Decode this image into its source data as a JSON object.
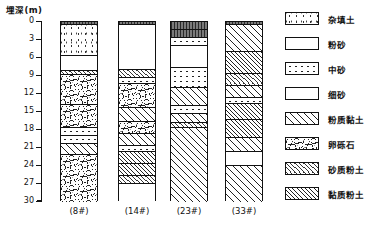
{
  "figure": {
    "axis_title": "埋深(m)",
    "axis": {
      "min": 0,
      "max": 30,
      "step": 3,
      "ticks": [
        "0",
        "3",
        "6",
        "9",
        "12",
        "15",
        "18",
        "21",
        "24",
        "27",
        "30"
      ]
    }
  },
  "legend": {
    "items": [
      {
        "label": "杂填土",
        "pattern": "p-fill"
      },
      {
        "label": "粉砂",
        "pattern": "p-siltsand"
      },
      {
        "label": "中砂",
        "pattern": "p-medsand"
      },
      {
        "label": "细砂",
        "pattern": "p-finesand"
      },
      {
        "label": "粉质黏土",
        "pattern": "p-siltclay"
      },
      {
        "label": "卵砾石",
        "pattern": "p-gravel"
      },
      {
        "label": "砂质粉土",
        "pattern": "p-sandysilt"
      },
      {
        "label": "黏质粉土",
        "pattern": "p-claysilt"
      }
    ]
  },
  "chart_data": {
    "type": "table",
    "ylabel": "埋深(m)",
    "ylim": [
      0,
      30
    ],
    "yticks": [
      0,
      3,
      6,
      9,
      12,
      15,
      18,
      21,
      24,
      27,
      30
    ],
    "boreholes": [
      {
        "name": "(8#)",
        "x": 60,
        "layers": [
          {
            "top": 0.0,
            "bottom": 0.5,
            "soil": "杂填土",
            "pattern": "p-crust"
          },
          {
            "top": 0.5,
            "bottom": 5.6,
            "soil": "杂填土",
            "pattern": "p-fill"
          },
          {
            "top": 5.6,
            "bottom": 8.2,
            "soil": "粉砂",
            "pattern": "p-siltsand"
          },
          {
            "top": 8.2,
            "bottom": 8.8,
            "soil": "砂质粉土",
            "pattern": "p-sandysilt"
          },
          {
            "top": 8.8,
            "bottom": 13.8,
            "soil": "卵砾石",
            "pattern": "p-gravel"
          },
          {
            "top": 13.8,
            "bottom": 17.6,
            "soil": "卵砾石",
            "pattern": "p-gravel"
          },
          {
            "top": 17.6,
            "bottom": 19.0,
            "soil": "中砂",
            "pattern": "p-medsand"
          },
          {
            "top": 19.0,
            "bottom": 20.4,
            "soil": "中砂",
            "pattern": "p-medsand"
          },
          {
            "top": 20.4,
            "bottom": 22.2,
            "soil": "粉质黏土",
            "pattern": "p-siltclay"
          },
          {
            "top": 22.2,
            "bottom": 30.0,
            "soil": "卵砾石",
            "pattern": "p-gravel"
          }
        ]
      },
      {
        "name": "(14#)",
        "x": 118,
        "layers": [
          {
            "top": 0.0,
            "bottom": 0.5,
            "soil": "杂填土",
            "pattern": "p-crust"
          },
          {
            "top": 0.5,
            "bottom": 8.0,
            "soil": "粉砂",
            "pattern": "p-siltsand"
          },
          {
            "top": 8.0,
            "bottom": 9.4,
            "soil": "砂质粉土",
            "pattern": "p-sandysilt"
          },
          {
            "top": 9.4,
            "bottom": 10.4,
            "soil": "中砂",
            "pattern": "p-medsand"
          },
          {
            "top": 10.4,
            "bottom": 14.4,
            "soil": "卵砾石",
            "pattern": "p-gravel"
          },
          {
            "top": 14.4,
            "bottom": 16.6,
            "soil": "粉质黏土",
            "pattern": "p-siltclay"
          },
          {
            "top": 16.6,
            "bottom": 18.6,
            "soil": "卵砾石",
            "pattern": "p-gravel"
          },
          {
            "top": 18.6,
            "bottom": 20.6,
            "soil": "粉质黏土",
            "pattern": "p-siltclay"
          },
          {
            "top": 20.6,
            "bottom": 21.6,
            "soil": "中砂",
            "pattern": "p-medsand"
          },
          {
            "top": 21.6,
            "bottom": 23.6,
            "soil": "黏质粉土",
            "pattern": "p-claysilt"
          },
          {
            "top": 23.6,
            "bottom": 25.6,
            "soil": "黏质粉土",
            "pattern": "p-claysilt"
          },
          {
            "top": 25.6,
            "bottom": 27.0,
            "soil": "砂质粉土",
            "pattern": "p-sandysilt"
          },
          {
            "top": 27.0,
            "bottom": 30.0,
            "soil": "细砂",
            "pattern": "p-finesand"
          }
        ]
      },
      {
        "name": "(23#)",
        "x": 170,
        "layers": [
          {
            "top": 0.0,
            "bottom": 1.4,
            "soil": "杂填土",
            "pattern": "p-crust"
          },
          {
            "top": 1.4,
            "bottom": 2.6,
            "soil": "杂填土",
            "pattern": "p-crust"
          },
          {
            "top": 2.6,
            "bottom": 4.0,
            "soil": "中砂",
            "pattern": "p-medsand"
          },
          {
            "top": 4.0,
            "bottom": 7.6,
            "soil": "粉砂",
            "pattern": "p-siltsand"
          },
          {
            "top": 7.6,
            "bottom": 11.0,
            "soil": "中砂",
            "pattern": "p-medsand"
          },
          {
            "top": 11.0,
            "bottom": 14.0,
            "soil": "粉质黏土",
            "pattern": "p-siltclay"
          },
          {
            "top": 14.0,
            "bottom": 15.4,
            "soil": "中砂",
            "pattern": "p-medsand"
          },
          {
            "top": 15.4,
            "bottom": 16.8,
            "soil": "粉质黏土",
            "pattern": "p-siltclay"
          },
          {
            "top": 16.8,
            "bottom": 17.6,
            "soil": "砂质粉土",
            "pattern": "p-sandysilt"
          },
          {
            "top": 17.6,
            "bottom": 30.0,
            "soil": "粉质黏土",
            "pattern": "p-siltclay"
          }
        ]
      },
      {
        "name": "(33#)",
        "x": 225,
        "layers": [
          {
            "top": 0.0,
            "bottom": 0.5,
            "soil": "杂填土",
            "pattern": "p-crust"
          },
          {
            "top": 0.5,
            "bottom": 5.0,
            "soil": "粉质黏土",
            "pattern": "p-siltclay"
          },
          {
            "top": 5.0,
            "bottom": 8.6,
            "soil": "黏质粉土",
            "pattern": "p-claysilt"
          },
          {
            "top": 8.6,
            "bottom": 10.6,
            "soil": "砂质粉土",
            "pattern": "p-sandysilt"
          },
          {
            "top": 10.6,
            "bottom": 12.6,
            "soil": "粉质黏土",
            "pattern": "p-siltclay"
          },
          {
            "top": 12.6,
            "bottom": 13.6,
            "soil": "中砂",
            "pattern": "p-medsand"
          },
          {
            "top": 13.6,
            "bottom": 16.4,
            "soil": "黏质粉土",
            "pattern": "p-claysilt"
          },
          {
            "top": 16.4,
            "bottom": 19.4,
            "soil": "黏质粉土",
            "pattern": "p-claysilt"
          },
          {
            "top": 19.4,
            "bottom": 21.6,
            "soil": "粉质黏土",
            "pattern": "p-siltclay"
          },
          {
            "top": 21.6,
            "bottom": 24.0,
            "soil": "细砂",
            "pattern": "p-finesand"
          },
          {
            "top": 24.0,
            "bottom": 30.0,
            "soil": "粉质黏土",
            "pattern": "p-siltclay"
          }
        ]
      }
    ]
  }
}
